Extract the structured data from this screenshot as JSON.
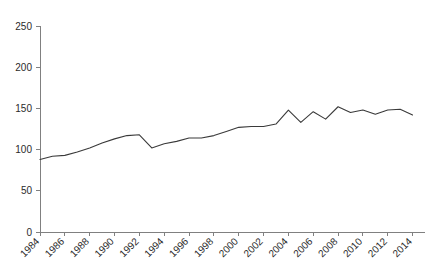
{
  "chart_data": {
    "type": "line",
    "title": "",
    "subtitle": "",
    "xlabel": "",
    "ylabel": "",
    "grid": false,
    "legend": false,
    "legend_position": "none",
    "line_color": "#3a3a3a",
    "axis_color": "#808080",
    "xlim": [
      1984,
      2015
    ],
    "ylim": [
      0,
      250
    ],
    "yticks": [
      0,
      50,
      100,
      150,
      200,
      250
    ],
    "ytick_labels": [
      "0",
      "50",
      "100",
      "150",
      "200",
      "250"
    ],
    "xticks": [
      1984,
      1986,
      1988,
      1990,
      1992,
      1994,
      1996,
      1998,
      2000,
      2002,
      2004,
      2006,
      2008,
      2010,
      2012,
      2014
    ],
    "xtick_labels": [
      "1984",
      "1986",
      "1988",
      "1990",
      "1992",
      "1994",
      "1996",
      "1998",
      "2000",
      "2002",
      "2004",
      "2006",
      "2008",
      "2010",
      "2012",
      "2014"
    ],
    "xtick_rotation": 45,
    "x": [
      1984,
      1985,
      1986,
      1987,
      1988,
      1989,
      1990,
      1991,
      1992,
      1993,
      1994,
      1995,
      1996,
      1997,
      1998,
      1999,
      2000,
      2001,
      2002,
      2003,
      2004,
      2005,
      2006,
      2007,
      2008,
      2009,
      2010,
      2011,
      2012,
      2013,
      2014
    ],
    "values": [
      88,
      92,
      93,
      97,
      102,
      108,
      113,
      117,
      118,
      102,
      107,
      110,
      114,
      114,
      117,
      122,
      127,
      128,
      128,
      131,
      148,
      133,
      146,
      137,
      152,
      145,
      148,
      143,
      148,
      149,
      142
    ],
    "series": [
      {
        "name": "series-1",
        "color": "#3a3a3a",
        "values": [
          88,
          92,
          93,
          97,
          102,
          108,
          113,
          117,
          118,
          102,
          107,
          110,
          114,
          114,
          117,
          122,
          127,
          128,
          128,
          131,
          148,
          133,
          146,
          137,
          152,
          145,
          148,
          143,
          148,
          149,
          142
        ]
      }
    ]
  },
  "plot_geometry": {
    "left": 40,
    "right": 425,
    "top": 26,
    "bottom": 232
  }
}
